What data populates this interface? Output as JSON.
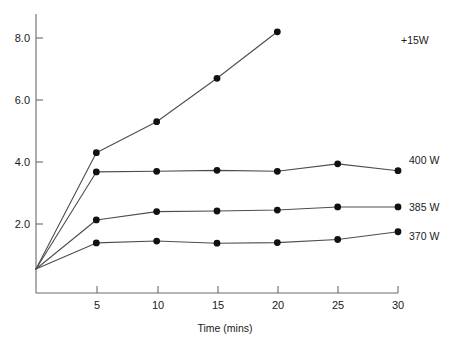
{
  "chart_data": {
    "type": "line",
    "title": "",
    "xlabel": "Time (mins)",
    "ylabel": "",
    "xlim": [
      0,
      31.5
    ],
    "ylim": [
      0,
      8.7
    ],
    "grid": false,
    "legend_position": "right-of-plot-end-labels",
    "xticks": [
      5,
      10,
      15,
      20,
      25,
      30
    ],
    "xtick_labels": [
      "5",
      "10",
      "15",
      "20",
      "25",
      "30"
    ],
    "yticks": [
      2.0,
      4.0,
      6.0,
      8.0
    ],
    "ytick_labels": [
      "2.0",
      "4.0",
      "6.0",
      "8.0"
    ],
    "series": [
      {
        "name": "+15W",
        "label": "+15W",
        "x": [
          0,
          5,
          10,
          15,
          20
        ],
        "values": [
          0.55,
          4.3,
          5.3,
          6.7,
          8.2
        ]
      },
      {
        "name": "400 W",
        "label": "400 W",
        "x": [
          0,
          5,
          10,
          15,
          20,
          25,
          30
        ],
        "values": [
          0.55,
          3.68,
          3.7,
          3.73,
          3.7,
          3.94,
          3.72
        ]
      },
      {
        "name": "385 W",
        "label": "385 W",
        "x": [
          0,
          5,
          10,
          15,
          20,
          25,
          30
        ],
        "values": [
          0.55,
          2.13,
          2.4,
          2.42,
          2.45,
          2.55,
          2.55
        ]
      },
      {
        "name": "370 W",
        "label": "370 W",
        "x": [
          0,
          5,
          10,
          15,
          20,
          25,
          30
        ],
        "values": [
          0.55,
          1.39,
          1.45,
          1.38,
          1.4,
          1.5,
          1.75
        ]
      }
    ],
    "colors": {
      "line": "#4d4d4d",
      "marker": "#111111",
      "axis": "#6b6b6b",
      "text": "#1a1a1a",
      "background": "#ffffff"
    }
  },
  "labels": {
    "series_0": "+15W",
    "series_1": "400 W",
    "series_2": "385 W",
    "series_3": "370 W",
    "xaxis_title": "Time (mins)",
    "ytick_0": "2.0",
    "ytick_1": "4.0",
    "ytick_2": "6.0",
    "ytick_3": "8.0",
    "xtick_0": "5",
    "xtick_1": "10",
    "xtick_2": "15",
    "xtick_3": "20",
    "xtick_4": "25",
    "xtick_5": "30"
  }
}
